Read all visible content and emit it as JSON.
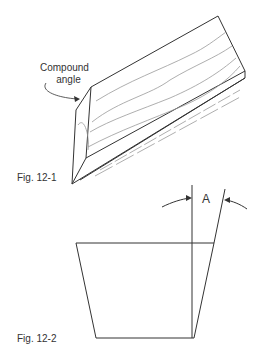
{
  "figures": [
    {
      "id": "fig-12-1",
      "caption": "Fig. 12-1",
      "callout": {
        "line1": "Compound",
        "line2": "angle"
      }
    },
    {
      "id": "fig-12-2",
      "caption": "Fig. 12-2",
      "angle_label": "A"
    }
  ],
  "colors": {
    "stroke": "#333333",
    "grain": "#999999",
    "background": "#ffffff"
  }
}
